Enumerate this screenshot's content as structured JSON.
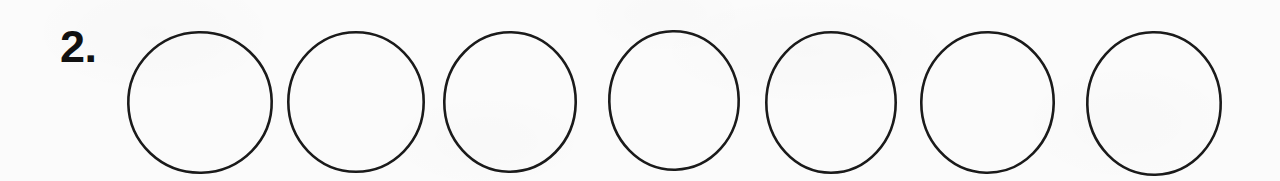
{
  "page": {
    "background_color": "#fbfbfb",
    "ink_color": "#1a1a1a",
    "width": 1280,
    "height": 181
  },
  "exercise": {
    "item_number_label": "2.",
    "circle_count": 7,
    "circles": [
      {
        "index": 1,
        "label": "",
        "filled": false,
        "x": 127,
        "y": 31,
        "width": 146,
        "height": 143
      },
      {
        "index": 2,
        "label": "",
        "filled": false,
        "x": 287,
        "y": 31,
        "width": 138,
        "height": 142
      },
      {
        "index": 3,
        "label": "",
        "filled": false,
        "x": 443,
        "y": 31,
        "width": 134,
        "height": 142
      },
      {
        "index": 4,
        "label": "",
        "filled": false,
        "x": 608,
        "y": 30,
        "width": 132,
        "height": 141
      },
      {
        "index": 5,
        "label": "",
        "filled": false,
        "x": 765,
        "y": 31,
        "width": 132,
        "height": 143
      },
      {
        "index": 6,
        "label": "",
        "filled": false,
        "x": 920,
        "y": 31,
        "width": 135,
        "height": 143
      },
      {
        "index": 7,
        "label": "",
        "filled": false,
        "x": 1086,
        "y": 31,
        "width": 136,
        "height": 145
      }
    ]
  }
}
